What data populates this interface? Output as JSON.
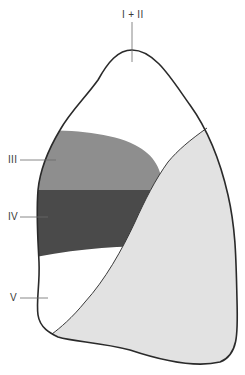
{
  "diagram": {
    "type": "lung segment schematic",
    "labels": {
      "apex": "I + II",
      "seg3": "III",
      "seg4": "IV",
      "seg5": "V"
    },
    "colors": {
      "outline": "#2a2a2a",
      "segment_III": "#8e8e8e",
      "segment_IV": "#4a4a4a",
      "segment_V": "#ffffff",
      "lower_lobe": "#e2e2e2",
      "upper_area": "#ffffff",
      "leader_line": "#6a6a6a"
    }
  }
}
